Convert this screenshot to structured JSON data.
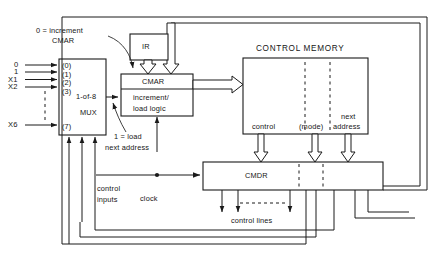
{
  "diagram": {
    "title_text": "CONTROL MEMORY",
    "blocks": {
      "ir": "IR",
      "cmar": "CMAR",
      "cmar_logic_line1": "increment/",
      "cmar_logic_line2": "load logic",
      "mux_line1": "1-of-8",
      "mux_line2": "MUX",
      "control_memory": "CONTROL MEMORY",
      "cmdr": "CMDR"
    },
    "mux_ports": [
      "(0)",
      "(1)",
      "(2)",
      "(3)",
      "(7)"
    ],
    "mux_inputs": [
      "0",
      "1",
      "X1",
      "X2",
      "X6"
    ],
    "annotations": {
      "increment_line1": "0 = increment",
      "increment_line2": "CMAR",
      "load_line1": "1 = load",
      "load_line2": "next address",
      "control_inputs_line1": "control",
      "control_inputs_line2": "inputs",
      "clock": "clock",
      "control_lines": "control lines"
    },
    "memory_fields": {
      "control": "control",
      "mode": "(mode)",
      "next_address_line1": "next",
      "next_address_line2": "address"
    },
    "colors": {
      "ink": "#1a1a1a",
      "background": "#ffffff"
    }
  }
}
